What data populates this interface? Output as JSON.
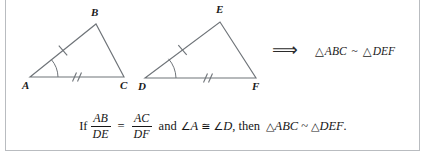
{
  "figure": {
    "line_color": "#6f7479",
    "label_color": "#1a1a1a",
    "background": "#ffffff",
    "border_color": "#b9bcc0",
    "triangle_1": {
      "name": "triangle-abc",
      "vertices": [
        {
          "label": "A",
          "x": 30,
          "y": 77,
          "label_x": 22,
          "label_y": 89
        },
        {
          "label": "B",
          "x": 96,
          "y": 24,
          "label_x": 91,
          "label_y": 16
        },
        {
          "label": "C",
          "x": 124,
          "y": 77,
          "label_x": 120,
          "label_y": 89
        }
      ],
      "side_ab_ticks": 1,
      "side_ac_ticks": 2,
      "angle_arc_at": "A"
    },
    "triangle_2": {
      "name": "triangle-def",
      "vertices": [
        {
          "label": "D",
          "x": 145,
          "y": 78,
          "label_x": 138,
          "label_y": 90
        },
        {
          "label": "E",
          "x": 220,
          "y": 22,
          "label_x": 216,
          "label_y": 13
        },
        {
          "label": "F",
          "x": 256,
          "y": 78,
          "label_x": 252,
          "label_y": 90
        }
      ],
      "side_de_ticks": 1,
      "side_df_ticks": 2,
      "angle_arc_at": "D"
    },
    "implication": {
      "arrow": "⟹",
      "conclusion_triangle_symbol": "△",
      "conclusion_left": "ABC",
      "similar_symbol": "~",
      "conclusion_right": "DEF"
    }
  },
  "caption": {
    "if_word": "If",
    "fraction_1": {
      "numerator": "AB",
      "denominator": "DE"
    },
    "equals": "=",
    "fraction_2": {
      "numerator": "AC",
      "denominator": "DF"
    },
    "and_word": "and",
    "angle_symbol": "∠",
    "angle_1": "A",
    "congruent_symbol": "≅",
    "angle_2": "D",
    "comma_then": ", then",
    "triangle_symbol": "△",
    "triangle_1_name": "ABC",
    "similar_symbol": "~",
    "triangle_2_name": "DEF",
    "period": "."
  }
}
